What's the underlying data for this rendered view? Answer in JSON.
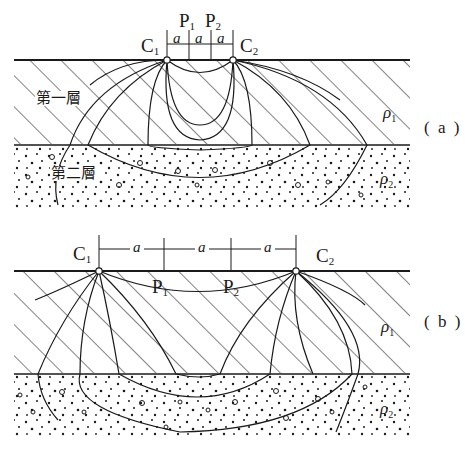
{
  "figure": {
    "panels": [
      {
        "id": "a",
        "label": "( a )",
        "electrodes": {
          "C1": "C",
          "C1_sub": "1",
          "C2": "C",
          "C2_sub": "2",
          "P1": "P",
          "P1_sub": "1",
          "P2": "P",
          "P2_sub": "2"
        },
        "spacings": [
          "a",
          "a",
          "a"
        ],
        "layers": [
          {
            "name": "第一層",
            "resistivity": "ρ",
            "resistivity_sub": "1",
            "pattern": "diagonal-hatch"
          },
          {
            "name": "第二層",
            "resistivity": "ρ",
            "resistivity_sub": "2",
            "pattern": "dotted-gravel"
          }
        ],
        "note": "Small electrode spacing: current lines concentrated in first layer"
      },
      {
        "id": "b",
        "label": "( b )",
        "electrodes": {
          "C1": "C",
          "C1_sub": "1",
          "C2": "C",
          "C2_sub": "2",
          "P1": "P",
          "P1_sub": "1",
          "P2": "P",
          "P2_sub": "2"
        },
        "spacings": [
          "a",
          "a",
          "a"
        ],
        "layers": [
          {
            "resistivity": "ρ",
            "resistivity_sub": "1",
            "pattern": "diagonal-hatch"
          },
          {
            "resistivity": "ρ",
            "resistivity_sub": "2",
            "pattern": "dotted-gravel"
          }
        ],
        "note": "Large electrode spacing: current lines penetrate into second layer"
      }
    ],
    "colors": {
      "ink": "#1a1a1a",
      "background": "#ffffff"
    }
  }
}
